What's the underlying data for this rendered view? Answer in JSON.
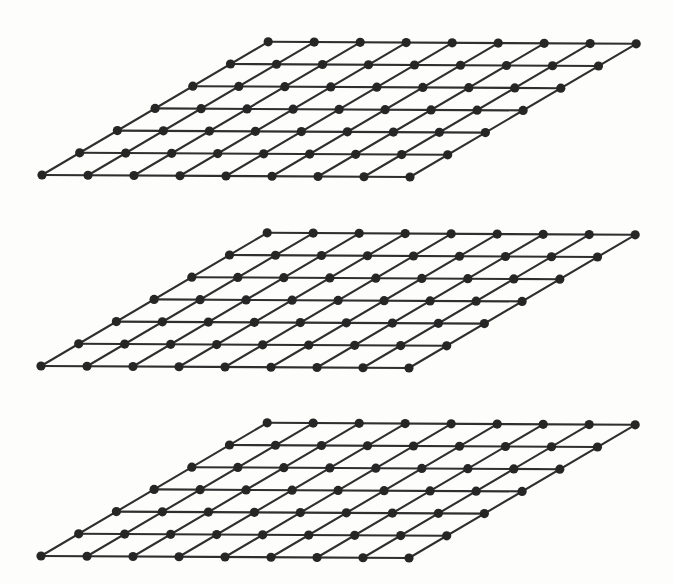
{
  "figure": {
    "kind": "lattice-planes-diagram",
    "background_color": "#fdfdfc",
    "width": 673,
    "height": 584,
    "node_color": "#262626",
    "edge_color": "#2f2f2f",
    "node_radius": 4.6,
    "edge_width": 2.1,
    "plane_count": 3,
    "planes": [
      {
        "name": "lattice-plane-top",
        "index": 1,
        "origin_x": 42,
        "origin_y": 175,
        "cols": 8,
        "rows": 6,
        "col_vector_x": 46.0,
        "col_vector_y": 0.25,
        "row_vector_x": 37.7,
        "row_vector_y": -22.2
      },
      {
        "name": "lattice-plane-middle",
        "index": 2,
        "origin_x": 41,
        "origin_y": 366,
        "cols": 8,
        "rows": 6,
        "col_vector_x": 46.0,
        "col_vector_y": 0.25,
        "row_vector_x": 37.7,
        "row_vector_y": -22.2
      },
      {
        "name": "lattice-plane-bottom",
        "index": 3,
        "origin_x": 41,
        "origin_y": 556,
        "cols": 8,
        "rows": 6,
        "col_vector_x": 46.0,
        "col_vector_y": 0.25,
        "row_vector_x": 37.7,
        "row_vector_y": -22.2
      }
    ]
  },
  "chart_data": {
    "type": "scatter",
    "xlabel": "",
    "ylabel": "",
    "grid": true,
    "legend": "none",
    "nodes_per_plane": 63,
    "nodes_per_row": 9,
    "nodes_per_column": 7,
    "cells_per_row": 8,
    "cells_per_column": 6,
    "total_nodes": 189,
    "plane_labels": [
      "lattice-plane-top",
      "lattice-plane-middle",
      "lattice-plane-bottom"
    ],
    "plane_origins": [
      [
        42,
        175
      ],
      [
        41,
        366
      ],
      [
        41,
        556
      ]
    ],
    "plane_vertical_pitch": 190,
    "series": [
      {
        "name": "lattice-plane-top",
        "node_count": 63
      },
      {
        "name": "lattice-plane-middle",
        "node_count": 63
      },
      {
        "name": "lattice-plane-bottom",
        "node_count": 63
      }
    ]
  }
}
